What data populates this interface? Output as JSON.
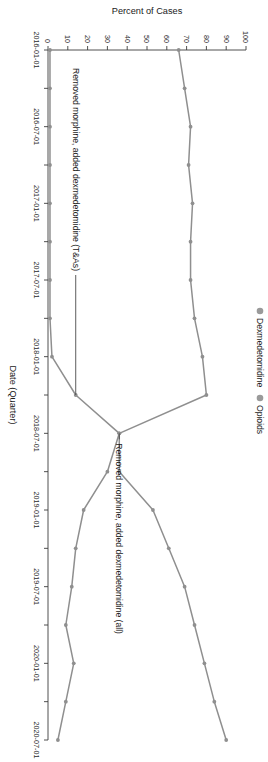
{
  "chart_data": {
    "type": "line",
    "title": "",
    "xlabel": "Date (Quarter)",
    "ylabel": "Percent of Cases",
    "ylim": [
      0,
      100
    ],
    "y_ticks": [
      0,
      10,
      20,
      30,
      40,
      50,
      60,
      70,
      80,
      90,
      100
    ],
    "grid": false,
    "legend_position": "top-left",
    "x": [
      "2016-01-01",
      "2016-04-01",
      "2016-07-01",
      "2016-10-01",
      "2017-01-01",
      "2017-04-01",
      "2017-07-01",
      "2017-10-01",
      "2018-01-01",
      "2018-04-01",
      "2018-07-01",
      "2018-10-01",
      "2019-01-01",
      "2019-04-01",
      "2019-07-01",
      "2019-10-01",
      "2020-01-01",
      "2020-04-01",
      "2020-07-01"
    ],
    "x_tick_labels": [
      "2016-01-01",
      "2016-07-01",
      "2017-01-01",
      "2017-07-01",
      "2018-01-01",
      "2018-07-01",
      "2019-01-01",
      "2019-07-01",
      "2020-01-01",
      "2020-07-01"
    ],
    "series": [
      {
        "name": "Dexmedetomidine",
        "color": "#8f8f8f",
        "values": [
          1,
          1,
          1,
          1,
          1,
          1,
          1,
          1,
          2,
          14,
          36,
          36,
          53,
          61,
          69,
          74,
          79,
          84,
          90
        ]
      },
      {
        "name": "Opioids",
        "color": "#8f8f8f",
        "values": [
          66,
          69,
          72,
          71,
          73,
          72,
          72,
          74,
          78,
          80,
          36,
          30,
          18,
          14,
          12,
          9,
          13,
          9,
          5
        ]
      }
    ],
    "annotations": [
      {
        "id": "annotation-tas",
        "text": "Removed morphine, added dexmedetomidine (T&As)",
        "points_to_x": "2018-04-01"
      },
      {
        "id": "annotation-all",
        "text": "Removed morphine, added dexmedetomidine (all)",
        "points_to_x": "2018-07-01"
      }
    ]
  },
  "legend": {
    "items": [
      {
        "label": "Dexmedetomidine",
        "color": "#9a9a9a"
      },
      {
        "label": "Opioids",
        "color": "#9a9a9a"
      }
    ]
  },
  "axes": {
    "x_title": "Date (Quarter)",
    "y_title": "Percent of Cases",
    "y_tick_labels": [
      "0",
      "10",
      "20",
      "30",
      "40",
      "50",
      "60",
      "70",
      "80",
      "90",
      "100"
    ],
    "x_tick_labels": [
      "2016-01-01",
      "2016-07-01",
      "2017-01-01",
      "2017-07-01",
      "2018-01-01",
      "2018-07-01",
      "2019-01-01",
      "2019-07-01",
      "2020-01-01",
      "2020-07-01"
    ]
  },
  "annotations": {
    "tas": "Removed morphine, added dexmedetomidine (T&As)",
    "all": "Removed morphine, added dexmedetomidine (all)"
  }
}
